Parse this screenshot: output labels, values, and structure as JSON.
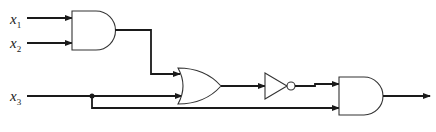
{
  "diagram": {
    "type": "logic-circuit",
    "inputs": [
      {
        "id": "x1",
        "label": "x",
        "sub": "1"
      },
      {
        "id": "x2",
        "label": "x",
        "sub": "2"
      },
      {
        "id": "x3",
        "label": "x",
        "sub": "3"
      }
    ],
    "gates": [
      {
        "id": "and1",
        "type": "AND",
        "inputs": [
          "x1",
          "x2"
        ]
      },
      {
        "id": "or1",
        "type": "OR",
        "inputs": [
          "and1",
          "x3"
        ]
      },
      {
        "id": "not1",
        "type": "NOT",
        "inputs": [
          "or1"
        ]
      },
      {
        "id": "and2",
        "type": "AND",
        "inputs": [
          "not1",
          "x3"
        ]
      }
    ],
    "output": "and2",
    "colors": {
      "line": "#1a1a1a",
      "background": "#ffffff"
    }
  }
}
